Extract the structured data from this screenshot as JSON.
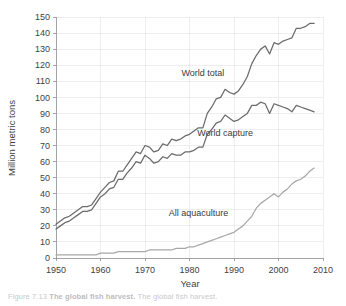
{
  "figure": {
    "caption_prefix": "Figure 7.13",
    "caption_strong": "The global fish harvest.",
    "caption_rest": "The global fish harvest."
  },
  "chart_data": {
    "type": "line",
    "title": "",
    "xlabel": "Year",
    "ylabel": "Million metric tons",
    "xlim": [
      1950,
      2010
    ],
    "ylim": [
      0,
      150
    ],
    "xticks": [
      1950,
      1960,
      1970,
      1980,
      1990,
      2000,
      2010
    ],
    "yticks": [
      0,
      10,
      20,
      30,
      40,
      50,
      60,
      70,
      80,
      90,
      100,
      110,
      120,
      130,
      140,
      150
    ],
    "xtick_labels": [
      "1950",
      "1960",
      "1970",
      "1980",
      "1990",
      "2000",
      "2010"
    ],
    "ytick_labels": [
      "0",
      "10",
      "20",
      "30",
      "40",
      "50",
      "60",
      "70",
      "80",
      "90",
      "100",
      "110",
      "120",
      "130",
      "140",
      "150"
    ],
    "grid": true,
    "legend_position": "inline-annotations",
    "x": [
      1950,
      1951,
      1952,
      1953,
      1954,
      1955,
      1956,
      1957,
      1958,
      1959,
      1960,
      1961,
      1962,
      1963,
      1964,
      1965,
      1966,
      1967,
      1968,
      1969,
      1970,
      1971,
      1972,
      1973,
      1974,
      1975,
      1976,
      1977,
      1978,
      1979,
      1980,
      1981,
      1982,
      1983,
      1984,
      1985,
      1986,
      1987,
      1988,
      1989,
      1990,
      1991,
      1992,
      1993,
      1994,
      1995,
      1996,
      1997,
      1998,
      1999,
      2000,
      2001,
      2002,
      2003,
      2004,
      2005,
      2006,
      2007,
      2008
    ],
    "series": [
      {
        "name": "World total",
        "color": "#6b6b6b",
        "label": "World total",
        "values": [
          21,
          23,
          25,
          26,
          28,
          30,
          32,
          32,
          33,
          37,
          41,
          44,
          47,
          48,
          54,
          54,
          58,
          62,
          66,
          65,
          70,
          69,
          66,
          67,
          71,
          70,
          74,
          73,
          74,
          76,
          77,
          79,
          81,
          81,
          90,
          94,
          99,
          100,
          105,
          103,
          102,
          104,
          108,
          113,
          121,
          126,
          130,
          132,
          127,
          134,
          133,
          135,
          136,
          137,
          143,
          143,
          144,
          146,
          146
        ]
      },
      {
        "name": "World capture",
        "color": "#6b6b6b",
        "label": "World capture",
        "values": [
          18,
          20,
          22,
          23,
          25,
          27,
          29,
          29,
          30,
          34,
          38,
          40,
          43,
          44,
          49,
          49,
          53,
          56,
          60,
          59,
          64,
          62,
          59,
          60,
          63,
          62,
          65,
          64,
          64,
          66,
          66,
          67,
          69,
          69,
          77,
          80,
          84,
          85,
          89,
          87,
          85,
          86,
          88,
          90,
          95,
          95,
          97,
          96,
          90,
          96,
          95,
          94,
          93,
          91,
          95,
          94,
          93,
          92,
          91
        ]
      },
      {
        "name": "All aquaculture",
        "color": "#a8a8a8",
        "label": "All aquaculture",
        "values": [
          2,
          2,
          2,
          2,
          2,
          2,
          2,
          2,
          2,
          2,
          3,
          3,
          3,
          3,
          4,
          4,
          4,
          4,
          4,
          4,
          4,
          5,
          5,
          5,
          5,
          5,
          5,
          6,
          6,
          6,
          7,
          7,
          8,
          9,
          10,
          11,
          12,
          13,
          14,
          15,
          16,
          18,
          20,
          23,
          26,
          31,
          34,
          36,
          38,
          40,
          38,
          41,
          43,
          46,
          48,
          49,
          51,
          54,
          56
        ]
      }
    ],
    "annotations": [
      {
        "text": "World total",
        "x": 1983,
        "y": 113
      },
      {
        "text": "World capture",
        "x": 1988,
        "y": 76
      },
      {
        "text": "All aquaculture",
        "x": 1982,
        "y": 26
      }
    ]
  }
}
